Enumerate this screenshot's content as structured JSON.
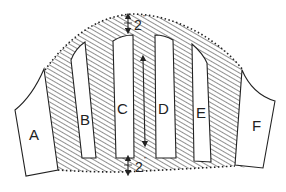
{
  "diagram": {
    "panels": [
      {
        "id": "A",
        "label": "A"
      },
      {
        "id": "B",
        "label": "B"
      },
      {
        "id": "C",
        "label": "C"
      },
      {
        "id": "D",
        "label": "D"
      },
      {
        "id": "E",
        "label": "E"
      },
      {
        "id": "F",
        "label": "F"
      }
    ],
    "dimensions": {
      "top_margin": {
        "value": "2",
        "unit": "\""
      },
      "bottom_margin": {
        "value": "2",
        "unit": "\""
      }
    },
    "colors": {
      "line": "#222222",
      "hatch": "#333333",
      "background": "#ffffff"
    }
  }
}
